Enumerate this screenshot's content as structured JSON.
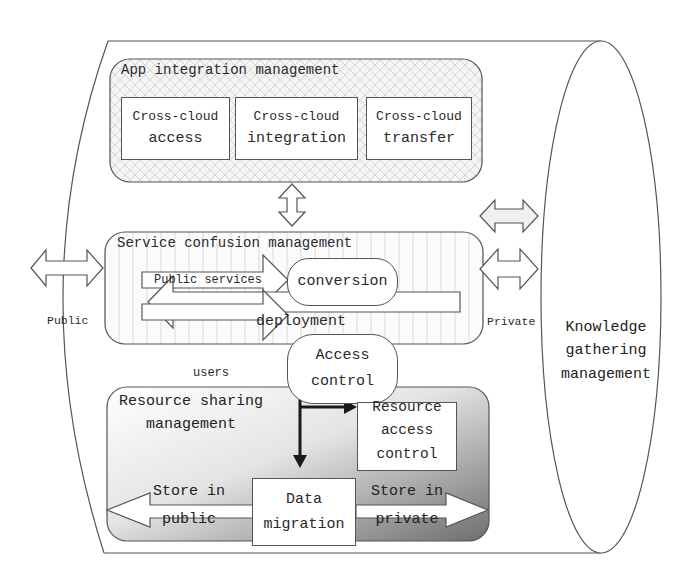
{
  "diagram": {
    "outer_container": {
      "label": "Knowledge gathering management",
      "lines": [
        "Knowledge",
        "gathering",
        "management"
      ]
    },
    "app_layer": {
      "title": "App integration management",
      "modules": [
        {
          "line1": "Cross-cloud",
          "line2": "access"
        },
        {
          "line1": "Cross-cloud",
          "line2": "integration"
        },
        {
          "line1": "Cross-cloud",
          "line2": "transfer"
        }
      ]
    },
    "service_layer": {
      "title": "Service confusion management",
      "public_services_label": "Public services",
      "conversion_label": "conversion",
      "deployment_label": "deployment",
      "users_label": "users",
      "access_control": {
        "line1": "Access",
        "line2": "control"
      }
    },
    "side_arrows": {
      "public_label": "Public",
      "private_label": "Private"
    },
    "resource_layer": {
      "title_line1": "Resource sharing",
      "title_line2": "management",
      "resource_access_control": {
        "line1": "Resource",
        "line2": "access",
        "line3": "control"
      },
      "data_migration": {
        "line1": "Data",
        "line2": "migration"
      },
      "store_public": {
        "line1": "Store in",
        "line2": "public"
      },
      "store_private": {
        "line1": "Store in",
        "line2": "private"
      }
    },
    "colors": {
      "stroke": "#555555",
      "text": "#2a2a2a",
      "arrow_dark": "#1a1a1a",
      "gradient_light": "#ffffff",
      "gradient_dark": "#7a7a7a"
    }
  }
}
